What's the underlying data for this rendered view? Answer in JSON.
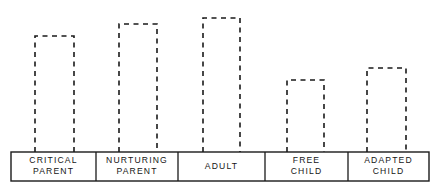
{
  "chart_data": {
    "type": "bar",
    "title": "",
    "subtitle": "",
    "xlabel": "",
    "ylabel": "",
    "categories": [
      "CRITICAL PARENT",
      "NURTURING PARENT",
      "ADULT",
      "FREE CHILD",
      "ADAPTED CHILD"
    ],
    "category_lines": [
      [
        "CRITICAL",
        "PARENT"
      ],
      [
        "NURTURING",
        "PARENT"
      ],
      [
        "ADULT"
      ],
      [
        "FREE",
        "CHILD"
      ],
      [
        "ADAPTED",
        "CHILD"
      ]
    ],
    "values": [
      116,
      128,
      134,
      72,
      84
    ],
    "ylim": [
      0,
      152
    ],
    "grid": false,
    "legend": null,
    "annotations": [],
    "style": {
      "bar_outline": "dashed",
      "bar_fill": "none",
      "bar_open_bottom": true,
      "stroke_color": "#1a1a1a",
      "background_color": "#ffffff"
    }
  },
  "axis": {
    "baseline_y": 152,
    "box_left": 11,
    "box_right": 429,
    "box_top": 152,
    "box_bottom": 181,
    "dividers": [
      96,
      178,
      265,
      348
    ]
  },
  "bars": [
    {
      "name": "critical-parent",
      "left": 35,
      "right": 74,
      "top": 36
    },
    {
      "name": "nurturing-parent",
      "left": 119,
      "right": 157,
      "top": 24
    },
    {
      "name": "adult",
      "left": 203,
      "right": 240,
      "top": 18
    },
    {
      "name": "free-child",
      "left": 287,
      "right": 324,
      "top": 80
    },
    {
      "name": "adapted-child",
      "left": 367,
      "right": 406,
      "top": 68
    }
  ]
}
